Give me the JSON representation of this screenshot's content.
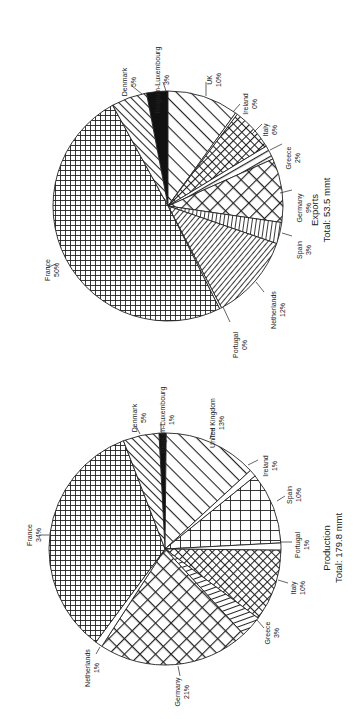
{
  "chart_data": [
    {
      "type": "pie",
      "title": "Production",
      "subtitle": "Total: 179.8 mmt",
      "categories": [
        "Belgium-Luxembourg",
        "United Kingdom",
        "Ireland",
        "Spain",
        "Portugal",
        "Italy",
        "Greece",
        "Germany",
        "Netherlands",
        "France",
        "Denmark"
      ],
      "values": [
        1,
        13,
        1,
        10,
        1,
        10,
        3,
        21,
        1,
        34,
        5
      ],
      "value_labels": [
        "1%",
        "13%",
        "1%",
        "10%",
        "1%",
        "10%",
        "3%",
        "21%",
        "1%",
        "34%",
        "5%"
      ],
      "unit": "%",
      "legend": "none (direct labels with leader lines)",
      "orientation": "page rotated 90° counter-clockwise"
    },
    {
      "type": "pie",
      "title": "Exports",
      "subtitle": "Total: 53.5 mmt",
      "categories": [
        "Belgium-Luxembourg",
        "UK",
        "Ireland",
        "Italy",
        "Greece",
        "Germany",
        "Spain",
        "Netherlands",
        "Portugal",
        "France",
        "Denmark"
      ],
      "values": [
        3,
        10,
        0,
        6,
        2,
        9,
        3,
        12,
        0,
        50,
        5
      ],
      "value_labels": [
        "3%",
        "10%",
        "0%",
        "6%",
        "2%",
        "9%",
        "3%",
        "12%",
        "0%",
        "50%",
        "5%"
      ],
      "unit": "%",
      "legend": "none (direct labels with leader lines)",
      "orientation": "page rotated 90° counter-clockwise"
    }
  ],
  "charts": {
    "production": {
      "title": "Production",
      "subtitle": "Total: 179.8 mmt",
      "center": [
        165,
        549
      ],
      "radius": 116,
      "start_angle": -3,
      "slices": [
        {
          "name": "Belgium-Luxembourg",
          "pct": "1%",
          "value": 1,
          "pattern": "solid"
        },
        {
          "name": "United Kingdom",
          "pct": "13%",
          "value": 13,
          "pattern": "diag-wide"
        },
        {
          "name": "Ireland",
          "pct": "1%",
          "value": 1,
          "pattern": "white"
        },
        {
          "name": "Spain",
          "pct": "10%",
          "value": 10,
          "pattern": "grid-wide"
        },
        {
          "name": "Portugal",
          "pct": "1%",
          "value": 1,
          "pattern": "white"
        },
        {
          "name": "Italy",
          "pct": "10%",
          "value": 10,
          "pattern": "crosshatch-fine"
        },
        {
          "name": "Greece",
          "pct": "3%",
          "value": 3,
          "pattern": "hlines"
        },
        {
          "name": "Germany",
          "pct": "21%",
          "value": 21,
          "pattern": "crosshatch-wide"
        },
        {
          "name": "Netherlands",
          "pct": "1%",
          "value": 1,
          "pattern": "white"
        },
        {
          "name": "France",
          "pct": "34%",
          "value": 34,
          "pattern": "grid-fine"
        },
        {
          "name": "Denmark",
          "pct": "5%",
          "value": 5,
          "pattern": "diag-back"
        }
      ]
    },
    "exports": {
      "title": "Exports",
      "subtitle": "Total: 53.5 mmt",
      "center": [
        168,
        206
      ],
      "radius": 115,
      "start_angle": -10.8,
      "slices": [
        {
          "name": "Belgium-Luxembourg",
          "pct": "3%",
          "value": 3,
          "pattern": "solid"
        },
        {
          "name": "UK",
          "pct": "10%",
          "value": 10,
          "pattern": "diag-wide"
        },
        {
          "name": "Ireland",
          "pct": "0%",
          "value": 0.3,
          "pattern": "white"
        },
        {
          "name": "Italy",
          "pct": "6%",
          "value": 6,
          "pattern": "crosshatch-fine"
        },
        {
          "name": "Greece",
          "pct": "2%",
          "value": 2,
          "pattern": "diag-mid"
        },
        {
          "name": "Germany",
          "pct": "9%",
          "value": 9,
          "pattern": "crosshatch-wide"
        },
        {
          "name": "Spain",
          "pct": "3%",
          "value": 3,
          "pattern": "vlines"
        },
        {
          "name": "Netherlands",
          "pct": "12%",
          "value": 12,
          "pattern": "diag-fine"
        },
        {
          "name": "Portugal",
          "pct": "0%",
          "value": 0.3,
          "pattern": "white"
        },
        {
          "name": "France",
          "pct": "50%",
          "value": 49.4,
          "pattern": "grid-fine"
        },
        {
          "name": "Denmark",
          "pct": "5%",
          "value": 5,
          "pattern": "diag-back"
        }
      ]
    }
  },
  "labels": {
    "exports": [
      {
        "name": "Belgium-Luxembourg",
        "pct": "3%",
        "x": 160,
        "y": 80,
        "lx1": 166,
        "ly1": 91,
        "lx2": 163,
        "ly2": 82
      },
      {
        "name": "Denmark",
        "pct": "5%",
        "x": 127,
        "y": 82,
        "lx1": 142,
        "ly1": 94,
        "lx2": 132,
        "ly2": 86
      },
      {
        "name": "UK",
        "pct": "10%",
        "x": 212,
        "y": 80,
        "lx1": 206,
        "ly1": 96,
        "lx2": 206,
        "ly2": 82
      },
      {
        "name": "Ireland",
        "pct": "0%",
        "x": 248,
        "y": 104,
        "lx1": 233,
        "ly1": 112,
        "lx2": 240,
        "ly2": 104
      },
      {
        "name": "Italy",
        "pct": "6%",
        "x": 268,
        "y": 130,
        "lx1": 252,
        "ly1": 134,
        "lx2": 262,
        "ly2": 124
      },
      {
        "name": "Greece",
        "pct": "2%",
        "x": 291,
        "y": 158,
        "lx1": 270,
        "ly1": 150,
        "lx2": 282,
        "ly2": 144
      },
      {
        "name": "Germany",
        "pct": "9%",
        "x": 302,
        "y": 208,
        "lx1": 280,
        "ly1": 193,
        "lx2": 292,
        "ly2": 190
      },
      {
        "name": "Spain",
        "pct": "3%",
        "x": 302,
        "y": 250,
        "lx1": 282,
        "ly1": 233,
        "lx2": 292,
        "ly2": 236
      },
      {
        "name": "Netherlands",
        "pct": "12%",
        "x": 276,
        "y": 310,
        "lx1": 256,
        "ly1": 282,
        "lx2": 264,
        "ly2": 292
      },
      {
        "name": "Portugal",
        "pct": "0%",
        "x": 238,
        "y": 345,
        "lx1": 223,
        "ly1": 307,
        "lx2": 230,
        "ly2": 322
      },
      {
        "name": "France",
        "pct": "50%",
        "x": 50,
        "y": 270,
        "lx1": 56,
        "ly1": 264,
        "lx2": 46,
        "ly2": 268
      }
    ],
    "production": [
      {
        "name": "Belgium-Luxembourg",
        "pct": "1%",
        "x": 165,
        "y": 420,
        "lx1": 161,
        "ly1": 432,
        "lx2": 161,
        "ly2": 422
      },
      {
        "name": "Denmark",
        "pct": "5%",
        "x": 137,
        "y": 418,
        "lx1": 140,
        "ly1": 434,
        "lx2": 136,
        "ly2": 426
      },
      {
        "name": "United Kingdom",
        "pct": "13%",
        "x": 215,
        "y": 423,
        "lx1": 210,
        "ly1": 439,
        "lx2": 213,
        "ly2": 428
      },
      {
        "name": "Ireland",
        "pct": "1%",
        "x": 268,
        "y": 466,
        "lx1": 248,
        "ly1": 465,
        "lx2": 258,
        "ly2": 460
      },
      {
        "name": "Spain",
        "pct": "10%",
        "x": 292,
        "y": 495,
        "lx1": 277,
        "ly1": 501,
        "lx2": 285,
        "ly2": 496
      },
      {
        "name": "Portugal",
        "pct": "1%",
        "x": 300,
        "y": 545,
        "lx1": 281,
        "ly1": 542,
        "lx2": 292,
        "ly2": 542
      },
      {
        "name": "Italy",
        "pct": "10%",
        "x": 296,
        "y": 588,
        "lx1": 278,
        "ly1": 580,
        "lx2": 288,
        "ly2": 583
      },
      {
        "name": "Greece",
        "pct": "3%",
        "x": 270,
        "y": 633,
        "lx1": 257,
        "ly1": 620,
        "lx2": 264,
        "ly2": 628
      },
      {
        "name": "Germany",
        "pct": "21%",
        "x": 180,
        "y": 692,
        "lx1": 178,
        "ly1": 666,
        "lx2": 180,
        "ly2": 676
      },
      {
        "name": "Netherlands",
        "pct": "1%",
        "x": 90,
        "y": 668,
        "lx1": 100,
        "ly1": 647,
        "lx2": 96,
        "ly2": 654
      },
      {
        "name": "France",
        "pct": "34%",
        "x": 32,
        "y": 535,
        "lx1": 49,
        "ly1": 535,
        "lx2": 40,
        "ly2": 535
      }
    ]
  }
}
